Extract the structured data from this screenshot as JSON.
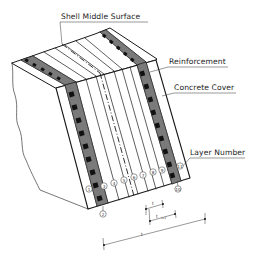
{
  "figure": {
    "type": "layered shell element isometric drawing",
    "labels": {
      "shell_middle_surface": "Shell Middle Surface",
      "reinforcement": "Reinforcement",
      "concrete_cover": "Concrete Cover",
      "layer_number": "Layer Number"
    },
    "layer_numbers": [
      "1",
      "3",
      "4",
      "5",
      "6",
      "7",
      "8",
      "9",
      "11"
    ],
    "bottom_markers": [
      "2",
      "10"
    ],
    "dimensions": {
      "total_thickness": "t",
      "layer_thickness": "t",
      "layer_thickness_sub": "t",
      "layer_thickness_index": "i+1"
    },
    "colors": {
      "line": "#1a1a1a",
      "reinforcement_fill": "#6e6e6e",
      "reinforcement_block": "#111111",
      "background": "#ffffff"
    }
  }
}
